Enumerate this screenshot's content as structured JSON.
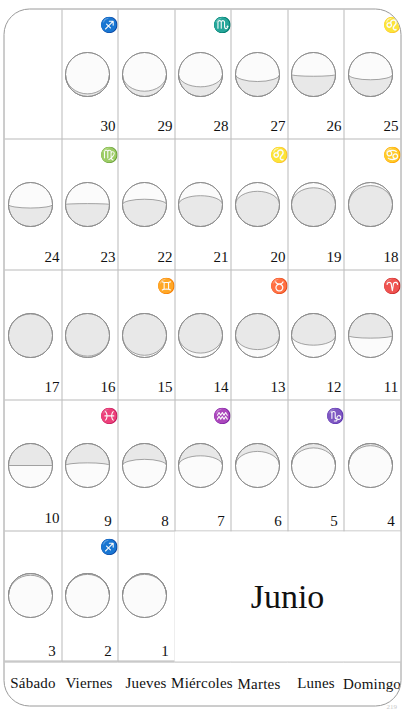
{
  "document": {
    "month_title": "Junio",
    "page_number": "219",
    "language": "es",
    "orientation": "rotated-90-ccw"
  },
  "colors": {
    "moon_lit": "#e8e8e8",
    "moon_dark": "#fbfbfb",
    "moon_outline": "#8d8d8d",
    "grid_line": "#b9b9b9",
    "card_border": "#9a9a9a",
    "text": "#111111",
    "page_number": "#c9c9c9"
  },
  "weekdays": [
    {
      "label": "Sábado"
    },
    {
      "label": "Viernes"
    },
    {
      "label": "Jueves"
    },
    {
      "label": "Miércoles"
    },
    {
      "label": "Martes"
    },
    {
      "label": "Lunes"
    },
    {
      "label": "Domingo"
    }
  ],
  "rows": [
    {
      "weekday": "Sábado",
      "cells": [
        {
          "day": "3",
          "zodiac": "",
          "phase": "new",
          "illum": 0.04,
          "waxing": true
        },
        {
          "day": "10",
          "zodiac": "",
          "phase": "first-quarter",
          "illum": 0.5,
          "waxing": true
        },
        {
          "day": "17",
          "zodiac": "",
          "phase": "full",
          "illum": 0.99,
          "waxing": false
        },
        {
          "day": "24",
          "zodiac": "",
          "phase": "last-quarter",
          "illum": 0.42,
          "waxing": false
        },
        {
          "day": "",
          "zodiac": "",
          "phase": "",
          "illum": 0,
          "waxing": true
        }
      ]
    },
    {
      "weekday": "Viernes",
      "cells": [
        {
          "day": "2",
          "zodiac": "♐",
          "zodiac_name": "sagittarius",
          "phase": "new",
          "illum": 0.02,
          "waxing": true
        },
        {
          "day": "9",
          "zodiac": "♓",
          "zodiac_name": "pisces",
          "phase": "waxing-gibbous",
          "illum": 0.44,
          "waxing": true
        },
        {
          "day": "16",
          "zodiac": "",
          "zodiac_name": "",
          "phase": "full",
          "illum": 0.97,
          "waxing": true
        },
        {
          "day": "23",
          "zodiac": "♍",
          "zodiac_name": "virgo",
          "phase": "waning-crescent",
          "illum": 0.52,
          "waxing": false
        },
        {
          "day": "30",
          "zodiac": "♐",
          "zodiac_name": "sagittarius",
          "phase": "new",
          "illum": 0.06,
          "waxing": false
        }
      ]
    },
    {
      "weekday": "Jueves",
      "cells": [
        {
          "day": "1",
          "zodiac": "",
          "zodiac_name": "",
          "phase": "new",
          "illum": 0.02,
          "waxing": true
        },
        {
          "day": "8",
          "zodiac": "",
          "zodiac_name": "",
          "phase": "waxing-crescent",
          "illum": 0.36,
          "waxing": true
        },
        {
          "day": "15",
          "zodiac": "♊",
          "zodiac_name": "gemini",
          "phase": "full",
          "illum": 0.95,
          "waxing": true
        },
        {
          "day": "22",
          "zodiac": "",
          "zodiac_name": "",
          "phase": "waning-gibbous",
          "illum": 0.62,
          "waxing": false
        },
        {
          "day": "29",
          "zodiac": "",
          "zodiac_name": "",
          "phase": "waning-crescent",
          "illum": 0.12,
          "waxing": false
        }
      ]
    },
    {
      "weekday": "Miércoles",
      "cells": [
        {
          "day": "",
          "zodiac": "",
          "zodiac_name": "",
          "phase": "",
          "illum": 0,
          "waxing": true
        },
        {
          "day": "7",
          "zodiac": "♒",
          "zodiac_name": "aquarius",
          "phase": "waxing-crescent",
          "illum": 0.28,
          "waxing": true
        },
        {
          "day": "14",
          "zodiac": "",
          "zodiac_name": "",
          "phase": "waxing-gibbous",
          "illum": 0.9,
          "waxing": true
        },
        {
          "day": "21",
          "zodiac": "",
          "zodiac_name": "",
          "phase": "waning-gibbous",
          "illum": 0.7,
          "waxing": false
        },
        {
          "day": "28",
          "zodiac": "♏",
          "zodiac_name": "scorpio",
          "phase": "waning-crescent",
          "illum": 0.22,
          "waxing": false
        }
      ]
    },
    {
      "weekday": "Martes",
      "cells": [
        {
          "day": "",
          "zodiac": "",
          "zodiac_name": "",
          "phase": "",
          "illum": 0,
          "waxing": true
        },
        {
          "day": "6",
          "zodiac": "",
          "zodiac_name": "",
          "phase": "waxing-crescent",
          "illum": 0.18,
          "waxing": true
        },
        {
          "day": "13",
          "zodiac": "♉",
          "zodiac_name": "taurus",
          "phase": "waxing-gibbous",
          "illum": 0.82,
          "waxing": true
        },
        {
          "day": "20",
          "zodiac": "♌",
          "zodiac_name": "leo",
          "phase": "waning-gibbous",
          "illum": 0.8,
          "waxing": false
        },
        {
          "day": "27",
          "zodiac": "",
          "zodiac_name": "",
          "phase": "waning-crescent",
          "illum": 0.34,
          "waxing": false
        }
      ]
    },
    {
      "weekday": "Lunes",
      "cells": [
        {
          "day": "",
          "zodiac": "",
          "zodiac_name": "",
          "phase": "",
          "illum": 0,
          "waxing": true
        },
        {
          "day": "5",
          "zodiac": "♑",
          "zodiac_name": "capricorn",
          "phase": "waxing-crescent",
          "illum": 0.1,
          "waxing": true
        },
        {
          "day": "12",
          "zodiac": "",
          "zodiac_name": "",
          "phase": "waxing-gibbous",
          "illum": 0.72,
          "waxing": true
        },
        {
          "day": "19",
          "zodiac": "",
          "zodiac_name": "",
          "phase": "waning-gibbous",
          "illum": 0.88,
          "waxing": false
        },
        {
          "day": "26",
          "zodiac": "",
          "zodiac_name": "",
          "phase": "waning-crescent",
          "illum": 0.46,
          "waxing": false
        }
      ]
    },
    {
      "weekday": "Domingo",
      "cells": [
        {
          "day": "",
          "zodiac": "",
          "zodiac_name": "",
          "phase": "",
          "illum": 0,
          "waxing": true
        },
        {
          "day": "4",
          "zodiac": "",
          "zodiac_name": "",
          "phase": "new",
          "illum": 0.05,
          "waxing": true
        },
        {
          "day": "11",
          "zodiac": "♈",
          "zodiac_name": "aries",
          "phase": "first-quarter",
          "illum": 0.56,
          "waxing": true
        },
        {
          "day": "18",
          "zodiac": "♋",
          "zodiac_name": "cancer",
          "phase": "full",
          "illum": 0.93,
          "waxing": false
        },
        {
          "day": "25",
          "zodiac": "♌",
          "zodiac_name": "leo",
          "phase": "last-quarter",
          "illum": 0.38,
          "waxing": false
        }
      ]
    }
  ]
}
